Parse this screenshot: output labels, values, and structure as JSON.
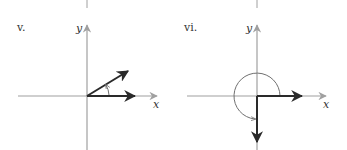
{
  "panels": [
    {
      "label": "v.",
      "axis_x_label": "x",
      "axis_y_label": "y",
      "description": "Two vectors from origin: one along positive x-axis, one in first quadrant; small arc arrow indicates positive angle between them"
    },
    {
      "label": "vi.",
      "axis_x_label": "x",
      "axis_y_label": "y",
      "description": "Two vectors from origin: one along positive x-axis, one along negative y-axis; large arc arrow indicates angle of 270 degrees counterclockwise"
    }
  ],
  "colors": {
    "axis": "#a0a0a0",
    "vector": "#2a2a2a",
    "arc": "#707070",
    "text": "#333333"
  }
}
